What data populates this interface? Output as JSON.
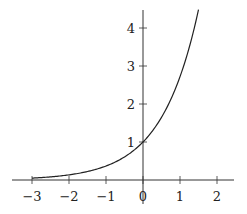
{
  "chart_data": {
    "type": "line",
    "title": "",
    "xlabel": "",
    "ylabel": "",
    "function": "y = e^x",
    "xlim": [
      -3.5,
      2.5
    ],
    "ylim": [
      0,
      4.5
    ],
    "grid": false,
    "legend": null,
    "x_ticks": [
      -3,
      -2,
      -1,
      0,
      1,
      2
    ],
    "x_tick_labels": [
      "−3",
      "−2",
      "−1",
      "0",
      "1",
      "2"
    ],
    "y_ticks": [
      1,
      2,
      3,
      4
    ],
    "y_tick_labels": [
      "1",
      "2",
      "3",
      "4"
    ],
    "series": [
      {
        "name": "exp(x)",
        "x": [
          -3,
          -2.5,
          -2,
          -1.5,
          -1,
          -0.5,
          0,
          0.5,
          1,
          1.5
        ],
        "y": [
          0.05,
          0.08,
          0.14,
          0.22,
          0.37,
          0.61,
          1.0,
          1.65,
          2.72,
          4.48
        ]
      }
    ],
    "annotations": []
  },
  "style": {
    "axis_color": "#333333",
    "curve_color": "#222222"
  }
}
